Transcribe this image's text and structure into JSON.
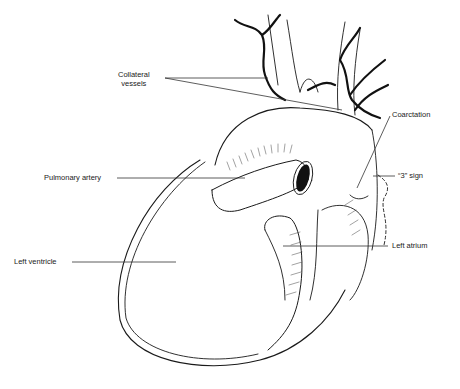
{
  "figure": {
    "labels": [
      {
        "id": "collateral-vessels",
        "text_line1": "Collateral",
        "text_line2": "vessels"
      },
      {
        "id": "coarctation",
        "text": "Coarctation"
      },
      {
        "id": "pulmonary-artery",
        "text": "Pulmonary artery"
      },
      {
        "id": "three-sign",
        "text": "“3” sign"
      },
      {
        "id": "left-atrium",
        "text": "Left atrium"
      },
      {
        "id": "left-ventricle",
        "text": "Left ventricle"
      }
    ]
  },
  "colors": {
    "background": "#ffffff",
    "ink": "#1a1a1a",
    "leader": "#333333"
  }
}
